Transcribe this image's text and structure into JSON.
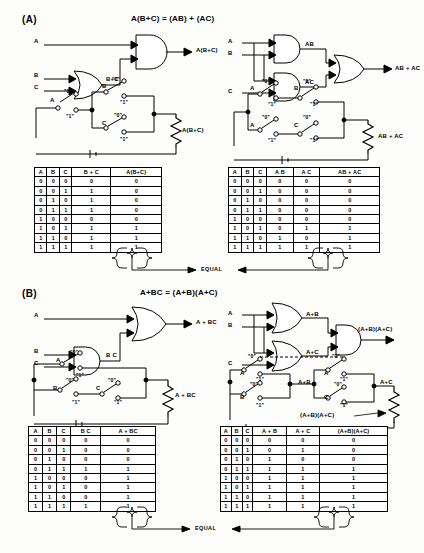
{
  "page": {
    "width": 419,
    "height": 553,
    "equal_label": "EQUAL"
  },
  "sections": [
    {
      "id": "A",
      "label": "(A)",
      "equation": "A(B+C) = (AB) + (AC)",
      "left": {
        "gate_diagram": {
          "inputs": [
            "A",
            "B",
            "C"
          ],
          "intermediate_label": "B+C",
          "output_label": "A(B+C)",
          "gates": [
            {
              "type": "OR",
              "inputs": [
                "B",
                "C"
              ],
              "out": "B+C"
            },
            {
              "type": "AND",
              "inputs": [
                "A",
                "B+C"
              ],
              "out": "A(B+C)"
            }
          ]
        },
        "switch_circuit": {
          "switch_labels": [
            "A",
            "B",
            "C"
          ],
          "position_labels": [
            "\"0\"",
            "\"1\""
          ],
          "output_label": "A(B+C)"
        },
        "truth_table": {
          "headers": [
            "A",
            "B",
            "C",
            "B + C",
            "A(B+C)"
          ],
          "rows": [
            [
              "0",
              "0",
              "0",
              "0",
              "0"
            ],
            [
              "0",
              "0",
              "1",
              "1",
              "0"
            ],
            [
              "0",
              "1",
              "0",
              "1",
              "0"
            ],
            [
              "0",
              "1",
              "1",
              "1",
              "0"
            ],
            [
              "1",
              "0",
              "0",
              "0",
              "0"
            ],
            [
              "1",
              "0",
              "1",
              "1",
              "1"
            ],
            [
              "1",
              "1",
              "0",
              "1",
              "1"
            ],
            [
              "1",
              "1",
              "1",
              "1",
              "1"
            ]
          ]
        }
      },
      "right": {
        "gate_diagram": {
          "inputs": [
            "A",
            "B",
            "C"
          ],
          "intermediate_labels": [
            "AB",
            "AC"
          ],
          "output_label": "AB + AC",
          "gates": [
            {
              "type": "AND",
              "inputs": [
                "A",
                "B"
              ],
              "out": "AB"
            },
            {
              "type": "AND",
              "inputs": [
                "A",
                "C"
              ],
              "out": "AC"
            },
            {
              "type": "OR",
              "inputs": [
                "AB",
                "AC"
              ],
              "out": "AB + AC"
            }
          ]
        },
        "switch_circuit": {
          "switch_labels": [
            "A",
            "B",
            "A",
            "C"
          ],
          "position_labels": [
            "\"0\"",
            "\"1\""
          ],
          "output_label": "AB + AC"
        },
        "truth_table": {
          "headers": [
            "A",
            "B",
            "C",
            "A B",
            "A C",
            "AB + AC"
          ],
          "rows": [
            [
              "0",
              "0",
              "0",
              "0",
              "0",
              "0"
            ],
            [
              "0",
              "0",
              "1",
              "0",
              "0",
              "0"
            ],
            [
              "0",
              "1",
              "0",
              "0",
              "0",
              "0"
            ],
            [
              "0",
              "1",
              "1",
              "0",
              "0",
              "0"
            ],
            [
              "1",
              "0",
              "0",
              "0",
              "0",
              "0"
            ],
            [
              "1",
              "0",
              "1",
              "0",
              "1",
              "1"
            ],
            [
              "1",
              "1",
              "0",
              "1",
              "0",
              "1"
            ],
            [
              "1",
              "1",
              "1",
              "1",
              "1",
              "1"
            ]
          ]
        }
      }
    },
    {
      "id": "B",
      "label": "(B)",
      "equation": "A+BC = (A+B)(A+C)",
      "left": {
        "gate_diagram": {
          "inputs": [
            "A",
            "B",
            "C"
          ],
          "intermediate_label": "B C",
          "output_label": "A + BC",
          "gates": [
            {
              "type": "AND",
              "inputs": [
                "B",
                "C"
              ],
              "out": "B C"
            },
            {
              "type": "OR",
              "inputs": [
                "A",
                "B C"
              ],
              "out": "A + BC"
            }
          ]
        },
        "switch_circuit": {
          "switch_labels": [
            "A",
            "B",
            "C"
          ],
          "position_labels": [
            "\"0\"",
            "\"1\""
          ],
          "output_label": "A + BC"
        },
        "truth_table": {
          "headers": [
            "A",
            "B",
            "C",
            "B C",
            "A + BC"
          ],
          "rows": [
            [
              "0",
              "0",
              "0",
              "0",
              "0"
            ],
            [
              "0",
              "0",
              "1",
              "0",
              "0"
            ],
            [
              "0",
              "1",
              "0",
              "0",
              "0"
            ],
            [
              "0",
              "1",
              "1",
              "1",
              "1"
            ],
            [
              "1",
              "0",
              "0",
              "0",
              "1"
            ],
            [
              "1",
              "0",
              "1",
              "0",
              "1"
            ],
            [
              "1",
              "1",
              "0",
              "0",
              "1"
            ],
            [
              "1",
              "1",
              "1",
              "1",
              "1"
            ]
          ]
        }
      },
      "right": {
        "gate_diagram": {
          "inputs": [
            "A",
            "B",
            "C"
          ],
          "intermediate_labels": [
            "A+B",
            "A+C"
          ],
          "output_label": "(A+B)(A+C)",
          "gates": [
            {
              "type": "OR",
              "inputs": [
                "A",
                "B"
              ],
              "out": "A+B"
            },
            {
              "type": "OR",
              "inputs": [
                "A",
                "C"
              ],
              "out": "A+C"
            },
            {
              "type": "AND",
              "inputs": [
                "A+B",
                "A+C"
              ],
              "out": "(A+B)(A+C)"
            }
          ]
        },
        "switch_circuit": {
          "switch_labels": [
            "A",
            "B",
            "A",
            "C"
          ],
          "position_labels": [
            "\"0\"",
            "\"1\""
          ],
          "block_labels": [
            "A+B",
            "A+C"
          ],
          "output_label": "(A+B)(A+C)"
        },
        "truth_table": {
          "headers": [
            "A",
            "B",
            "C",
            "A + B",
            "A + C",
            "(A+B)(A+C)"
          ],
          "rows": [
            [
              "0",
              "0",
              "0",
              "0",
              "0",
              "0"
            ],
            [
              "0",
              "0",
              "1",
              "0",
              "1",
              "0"
            ],
            [
              "0",
              "1",
              "0",
              "1",
              "0",
              "0"
            ],
            [
              "0",
              "1",
              "1",
              "1",
              "1",
              "1"
            ],
            [
              "1",
              "0",
              "0",
              "1",
              "1",
              "1"
            ],
            [
              "1",
              "0",
              "1",
              "1",
              "1",
              "1"
            ],
            [
              "1",
              "1",
              "0",
              "1",
              "1",
              "1"
            ],
            [
              "1",
              "1",
              "1",
              "1",
              "1",
              "1"
            ]
          ]
        }
      }
    }
  ]
}
